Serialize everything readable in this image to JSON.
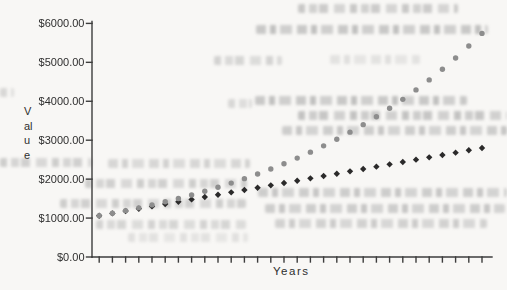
{
  "page": {
    "background_color": "#f8f7f5"
  },
  "chart_data": {
    "type": "scatter",
    "title": "",
    "xlabel": "Years",
    "ylabel": "Value",
    "xlim": [
      0,
      31
    ],
    "ylim": [
      0,
      6000
    ],
    "grid": "off",
    "legend": "none",
    "x_tick_count": 30,
    "y_tick_labels": [
      "$6000.00",
      "$5000.00",
      "$4000.00",
      "$3000.00",
      "$2000.00",
      "$1000.00",
      "$0.00"
    ],
    "y_tick_values": [
      6000,
      5000,
      4000,
      3000,
      2000,
      1000,
      0
    ],
    "x_years": [
      1,
      2,
      3,
      4,
      5,
      6,
      7,
      8,
      9,
      10,
      11,
      12,
      13,
      14,
      15,
      16,
      17,
      18,
      19,
      20,
      21,
      22,
      23,
      24,
      25,
      26,
      27,
      28,
      29,
      30
    ],
    "axis_color": "#3d3d3d",
    "label_color": "#2e2e2e",
    "series": [
      {
        "name": "upper-series-gray-circles",
        "marker": "circle",
        "color": "#8d8d8d",
        "values": [
          1060.0,
          1123.6,
          1191.02,
          1262.48,
          1338.23,
          1418.52,
          1503.63,
          1593.85,
          1689.48,
          1790.85,
          1898.3,
          2012.2,
          2132.93,
          2260.9,
          2396.56,
          2540.35,
          2692.77,
          2854.34,
          3025.6,
          3207.14,
          3399.56,
          3603.54,
          3819.75,
          4048.93,
          4291.89,
          4549.38,
          4822.35,
          5111.69,
          5418.39,
          5743.49
        ]
      },
      {
        "name": "lower-series-dark-diamonds",
        "marker": "diamond",
        "color": "#2b2a2a",
        "values": [
          1060,
          1120,
          1180,
          1240,
          1300,
          1360,
          1420,
          1480,
          1540,
          1600,
          1660,
          1720,
          1780,
          1840,
          1900,
          1960,
          2020,
          2080,
          2140,
          2200,
          2260,
          2320,
          2380,
          2440,
          2500,
          2560,
          2620,
          2680,
          2740,
          2800
        ]
      }
    ]
  }
}
